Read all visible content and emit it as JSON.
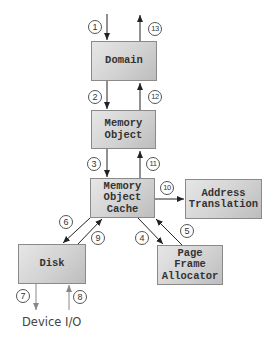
{
  "diagram": {
    "type": "flow",
    "colors": {
      "box_fill": "#d2d2d2",
      "box_border": "#8a8a8a",
      "arrow": "#222222",
      "io_arrow": "#888888",
      "text": "#333333"
    },
    "nodes": [
      {
        "id": "domain",
        "label": "Domain"
      },
      {
        "id": "memory-object",
        "label": "Memory\nObject"
      },
      {
        "id": "memory-object-cache",
        "label": "Memory\nObject\nCache"
      },
      {
        "id": "address-translation",
        "label": "Address\nTranslation"
      },
      {
        "id": "disk",
        "label": "Disk"
      },
      {
        "id": "page-frame-allocator",
        "label": "Page\nFrame\nAllocator"
      }
    ],
    "external_label": "Device I/O",
    "steps": [
      {
        "n": "1",
        "from": "caller",
        "to": "domain"
      },
      {
        "n": "2",
        "from": "domain",
        "to": "memory-object"
      },
      {
        "n": "3",
        "from": "memory-object",
        "to": "memory-object-cache"
      },
      {
        "n": "4",
        "from": "memory-object-cache",
        "to": "page-frame-allocator"
      },
      {
        "n": "5",
        "from": "page-frame-allocator",
        "to": "memory-object-cache"
      },
      {
        "n": "6",
        "from": "memory-object-cache",
        "to": "disk"
      },
      {
        "n": "7",
        "from": "disk",
        "to": "device-io"
      },
      {
        "n": "8",
        "from": "device-io",
        "to": "disk"
      },
      {
        "n": "9",
        "from": "disk",
        "to": "memory-object-cache"
      },
      {
        "n": "10",
        "from": "memory-object-cache",
        "to": "address-translation"
      },
      {
        "n": "11",
        "from": "memory-object-cache",
        "to": "memory-object"
      },
      {
        "n": "12",
        "from": "memory-object",
        "to": "domain"
      },
      {
        "n": "13",
        "from": "domain",
        "to": "caller"
      }
    ]
  }
}
